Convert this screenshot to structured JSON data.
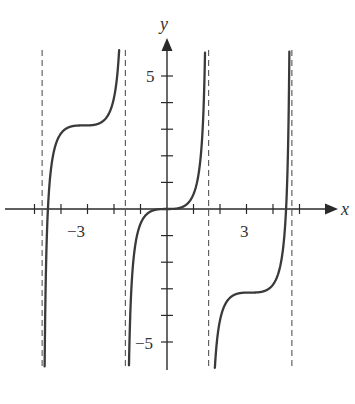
{
  "chart_data": {
    "type": "line",
    "title": "",
    "function": "y = tan(x) - x",
    "xlabel": "x",
    "ylabel": "y",
    "xlim": [
      -6.3,
      6.4
    ],
    "ylim": [
      -6.0,
      6.0
    ],
    "grid": false,
    "legend": null,
    "x_tick_values": [
      -5,
      -4,
      -3,
      -2,
      -1,
      1,
      2,
      3,
      4,
      5
    ],
    "y_tick_values": [
      -5,
      -4,
      -3,
      -2,
      -1,
      1,
      2,
      3,
      4,
      5
    ],
    "x_tick_labels": [
      {
        "value": -3,
        "label": "−3"
      },
      {
        "value": 3,
        "label": "3"
      }
    ],
    "y_tick_labels": [
      {
        "value": 5,
        "label": "5"
      },
      {
        "value": -5,
        "label": "−5"
      }
    ],
    "asymptotes_x": [
      -4.712,
      -1.571,
      1.571,
      4.712
    ],
    "series": [
      {
        "name": "branch-1",
        "domain": [
          -4.712,
          -1.571
        ],
        "points": [
          [
            -4.6,
            -4.5
          ],
          [
            -4.49,
            0
          ],
          [
            -4.2,
            2.0
          ],
          [
            -3.6,
            3.1
          ],
          [
            -3.1416,
            3.1416
          ],
          [
            -2.6,
            3.2
          ],
          [
            -2.2,
            3.6
          ],
          [
            -1.9,
            4.8
          ],
          [
            -1.75,
            6.0
          ]
        ]
      },
      {
        "name": "branch-2",
        "domain": [
          -1.571,
          1.571
        ],
        "points": [
          [
            -1.4,
            -4.4
          ],
          [
            -1.2,
            -1.4
          ],
          [
            -0.8,
            -0.23
          ],
          [
            0,
            0
          ],
          [
            0.8,
            0.23
          ],
          [
            1.2,
            1.4
          ],
          [
            1.4,
            4.4
          ]
        ]
      },
      {
        "name": "branch-3",
        "domain": [
          1.571,
          4.712
        ],
        "points": [
          [
            1.75,
            -6.0
          ],
          [
            1.9,
            -4.8
          ],
          [
            2.2,
            -3.6
          ],
          [
            2.6,
            -3.2
          ],
          [
            3.1416,
            -3.1416
          ],
          [
            3.6,
            -3.1
          ],
          [
            4.2,
            -2.0
          ],
          [
            4.49,
            0
          ],
          [
            4.6,
            4.5
          ]
        ]
      }
    ]
  },
  "labels": {
    "x_axis": "x",
    "y_axis": "y",
    "x_neg3": "−3",
    "x_pos3": "3",
    "y_pos5": "5",
    "y_neg5": "−5"
  },
  "colors": {
    "curve": "#3a3a3a",
    "axis": "#2a2a2a",
    "asymptote": "#555555",
    "background": "#ffffff"
  }
}
